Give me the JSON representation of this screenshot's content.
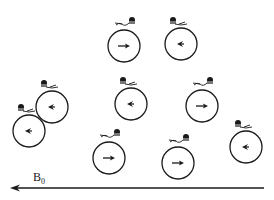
{
  "figure": {
    "field_label": "B",
    "field_subscript": "0",
    "field_arrow": {
      "x1": 264,
      "x2": 10,
      "y": 188,
      "direction": "left",
      "color": "#1a1a1a"
    },
    "line_color": "#1a1a1a",
    "circle_radius": 16,
    "spins": [
      {
        "cx": 52,
        "cy": 107,
        "arrow": "left",
        "swimmer": "left"
      },
      {
        "cx": 124,
        "cy": 46,
        "arrow": "right",
        "swimmer": "right"
      },
      {
        "cx": 181,
        "cy": 44,
        "arrow": "left",
        "swimmer": "left"
      },
      {
        "cx": 29,
        "cy": 131,
        "arrow": "left",
        "swimmer": "left"
      },
      {
        "cx": 131,
        "cy": 104,
        "arrow": "left",
        "swimmer": "left"
      },
      {
        "cx": 202,
        "cy": 106,
        "arrow": "right",
        "swimmer": "right"
      },
      {
        "cx": 109,
        "cy": 158,
        "arrow": "right",
        "swimmer": "right"
      },
      {
        "cx": 178,
        "cy": 163,
        "arrow": "right",
        "swimmer": "right"
      },
      {
        "cx": 246,
        "cy": 147,
        "arrow": "left",
        "swimmer": "left"
      }
    ]
  }
}
